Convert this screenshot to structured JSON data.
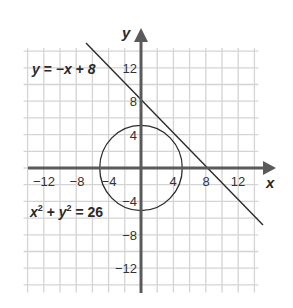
{
  "chart_data": {
    "type": "line",
    "title": "",
    "xlabel": "x",
    "ylabel": "y",
    "xlim": [
      -14,
      14
    ],
    "ylim": [
      -15,
      14
    ],
    "grid": true,
    "grid_step": 2,
    "x_ticks": [
      -12,
      -8,
      -4,
      4,
      8,
      12
    ],
    "y_ticks": [
      12,
      8,
      4,
      -4,
      -8,
      -12
    ],
    "x_tick_labels": [
      "−12",
      "−8",
      "−4",
      "4",
      "8",
      "12"
    ],
    "y_tick_labels": [
      "12",
      "8",
      "4",
      "−4",
      "−8",
      "−12"
    ],
    "series": [
      {
        "name": "y = −x + 8",
        "kind": "line",
        "equation": "y = -x + 8",
        "slope": -1,
        "intercept": 8,
        "x_range": [
          -6.8,
          15
        ],
        "points": [
          [
            -6.8,
            14.8
          ],
          [
            0,
            8
          ],
          [
            8,
            0
          ],
          [
            15,
            -7
          ]
        ]
      },
      {
        "name": "x² + y² = 26",
        "kind": "circle",
        "equation": "x^2 + y^2 = 26",
        "center": [
          0,
          0
        ],
        "radius": 5.099
      }
    ],
    "annotations": [
      {
        "text": "y = −x + 8",
        "position": "upper-left"
      },
      {
        "text": "x² + y² = 26",
        "position": "lower-left"
      }
    ]
  },
  "labels": {
    "x_axis": "x",
    "y_axis": "y",
    "line_eq": {
      "y": "y",
      "eqsign": " = ",
      "rhs": "−x + 8"
    },
    "circle_eq": {
      "x": "x",
      "sup1": "2",
      "plus": " + ",
      "y": "y",
      "sup2": "2",
      "rhs": " = 26"
    }
  },
  "ticks": {
    "x": [
      {
        "label": "−12",
        "px": 44
      },
      {
        "label": "−8",
        "px": 77
      },
      {
        "label": "−4",
        "px": 109
      },
      {
        "label": "4",
        "px": 173
      },
      {
        "label": "8",
        "px": 206
      },
      {
        "label": "12",
        "px": 238
      }
    ],
    "y": [
      {
        "label": "12",
        "py": 68
      },
      {
        "label": "8",
        "py": 101
      },
      {
        "label": "4",
        "py": 135
      },
      {
        "label": "−4",
        "py": 201
      },
      {
        "label": "−8",
        "py": 235
      },
      {
        "label": "−12",
        "py": 268
      }
    ]
  },
  "colors": {
    "grid": "#d4d4d4",
    "axis": "#5a5a5a",
    "curve": "#2b2b2b",
    "text": "#2a2a2a"
  }
}
